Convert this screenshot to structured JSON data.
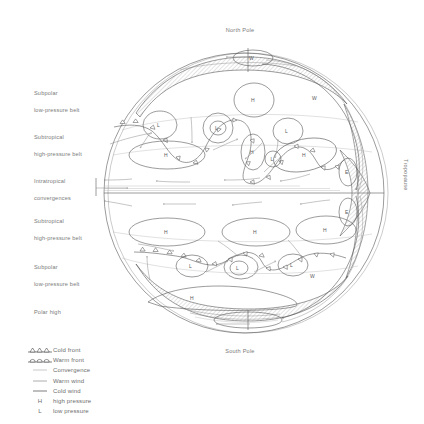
{
  "figure": {
    "poles": {
      "north": "North Pole",
      "south": "South Pole"
    },
    "side_label": "Tropopause",
    "belt_labels": [
      {
        "line1": "Subpolar",
        "line2": "low-pressure belt",
        "top": 81
      },
      {
        "line1": "Subtropical",
        "line2": "high-pressure belt",
        "top": 125
      },
      {
        "line1": "Intratropical",
        "line2": "convergences",
        "top": 169
      },
      {
        "line1": "Subtropical",
        "line2": "high-pressure belt",
        "top": 209
      },
      {
        "line1": "Subpolar",
        "line2": "low-pressure belt",
        "top": 255
      },
      {
        "line1": "Polar high",
        "line2": "",
        "top": 300
      }
    ],
    "map_glyphs": {
      "high_pressure": "H",
      "low_pressure": "L",
      "westerlies": "W",
      "easterlies": "E"
    }
  },
  "legend": {
    "items": [
      {
        "symbol": "cold-front",
        "label": "Cold front"
      },
      {
        "symbol": "warm-front",
        "label": "Warm front"
      },
      {
        "symbol": "line",
        "label": "Convergence"
      },
      {
        "symbol": "line",
        "label": "Warm wind"
      },
      {
        "symbol": "line",
        "label": "Cold wind"
      },
      {
        "symbol": "glyph-H",
        "glyph": "H",
        "label": "high pressure"
      },
      {
        "symbol": "glyph-L",
        "glyph": "L",
        "label": "low pressure"
      }
    ]
  },
  "colors": {
    "ink": "#4a4a4a",
    "light_ink": "#8e8e8e",
    "very_light_ink": "#b4b4b4",
    "text": "#7a7a7a",
    "background": "#ffffff"
  }
}
